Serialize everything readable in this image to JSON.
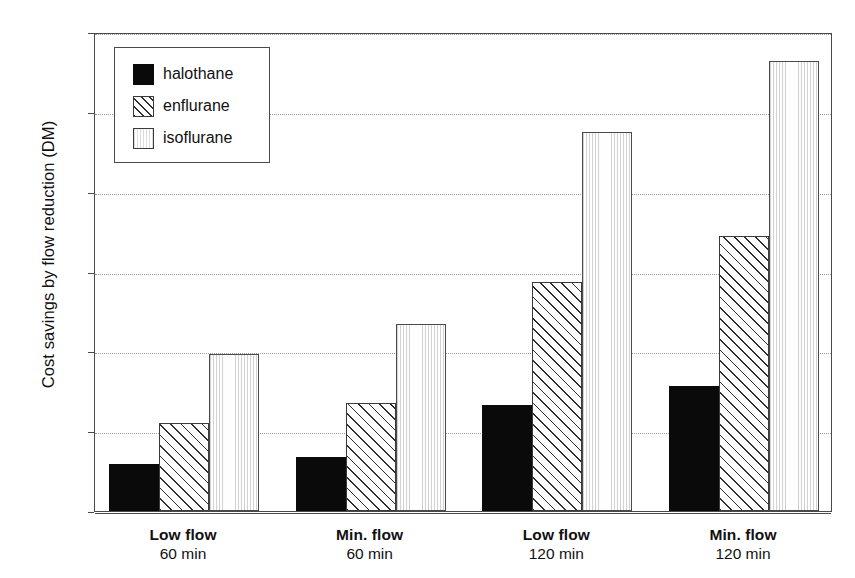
{
  "chart_data": {
    "type": "bar",
    "title": "",
    "subtitle": "",
    "xlabel": "",
    "ylabel": "Cost savings by flow reduction (DM)",
    "ylim": [
      0,
      30
    ],
    "yticks": [
      0,
      5,
      10,
      15,
      20,
      25,
      30
    ],
    "ytick_labels": [
      "0",
      "5",
      "10",
      "15",
      "20",
      "25",
      "30"
    ],
    "grid": "horizontal-dotted",
    "legend_position": "top-left-inside",
    "categories": [
      "Low flow\n60 min",
      "Min. flow\n60 min",
      "Low flow\n120 min",
      "Min. flow\n120 min"
    ],
    "category_lines": [
      {
        "line1": "Low flow",
        "line2": "60 min"
      },
      {
        "line1": "Min. flow",
        "line2": "60 min"
      },
      {
        "line1": "Low flow",
        "line2": "120 min"
      },
      {
        "line1": "Min. flow",
        "line2": "120 min"
      }
    ],
    "series": [
      {
        "name": "halothane",
        "key": "halothane",
        "fill": "solid-black",
        "values": [
          2.95,
          3.4,
          6.65,
          7.8
        ]
      },
      {
        "name": "enflurane",
        "key": "enflurane",
        "fill": "diagonal-hatch",
        "values": [
          5.5,
          6.75,
          14.35,
          17.25
        ]
      },
      {
        "name": "isoflurane",
        "key": "isoflurane",
        "fill": "vertical-lines",
        "values": [
          9.85,
          11.7,
          23.75,
          28.2
        ]
      }
    ]
  },
  "legend": {
    "items": [
      {
        "label": "halothane",
        "key": "halothane"
      },
      {
        "label": "enflurane",
        "key": "enflurane"
      },
      {
        "label": "isoflurane",
        "key": "isoflurane"
      }
    ]
  },
  "colors": {
    "halothane": "#0a0a0a",
    "enflurane": "#2e2e2e",
    "isoflurane": "#d2d2d2",
    "axis": "#4a4a4a",
    "grid": "#9b9b9b",
    "text": "#111111",
    "background": "#ffffff"
  }
}
